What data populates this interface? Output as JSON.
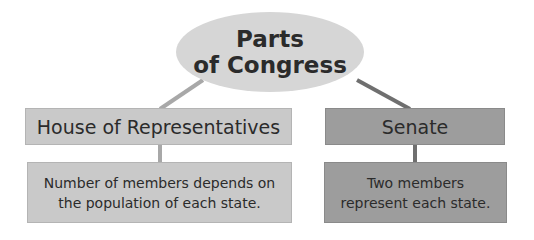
{
  "root": {
    "line1": "Parts",
    "line2": "of Congress"
  },
  "branches": [
    {
      "title": "House of Representatives",
      "description_line1": "Number of members depends on",
      "description_line2": "the population of each state."
    },
    {
      "title": "Senate",
      "description_line1": "Two members",
      "description_line2": "represent each state."
    }
  ],
  "colors": {
    "oval": "#d6d6d6",
    "house_box": "#c9c9c9",
    "senate_box": "#9d9d9d",
    "house_connector": "#a8a8a8",
    "senate_connector": "#6f6f6f"
  }
}
